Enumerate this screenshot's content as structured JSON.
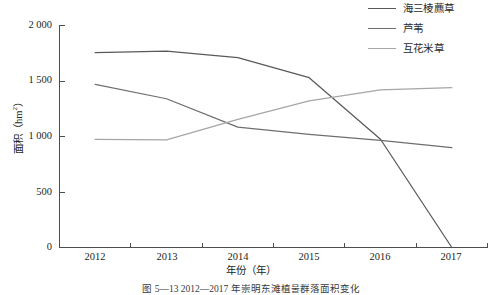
{
  "chart_data": {
    "type": "line",
    "title": "",
    "xlabel": "年份（年）",
    "ylabel": "面积（hm²）",
    "categories": [
      "2012",
      "2013",
      "2014",
      "2015",
      "2016",
      "2017"
    ],
    "x": [
      2012,
      2013,
      2014,
      2015,
      2016,
      2017
    ],
    "xlim": [
      2011.5,
      2017.5
    ],
    "ylim": [
      0,
      2000
    ],
    "yticks": [
      0,
      500,
      1000,
      1500,
      2000
    ],
    "ytick_labels": [
      "0",
      "500",
      "1 000",
      "1 500",
      "2 000"
    ],
    "xtick_labels": [
      "2012",
      "2013",
      "2014",
      "2015",
      "2016",
      "2017"
    ],
    "grid": false,
    "legend_position": "top-right",
    "series": [
      {
        "name": "海三棱藨草",
        "color": "#59595b",
        "values": [
          1755,
          1770,
          1710,
          1530,
          975,
          0
        ]
      },
      {
        "name": "芦苇",
        "color": "#6e6e70",
        "values": [
          1470,
          1340,
          1085,
          1020,
          965,
          900
        ]
      },
      {
        "name": "互花米草",
        "color": "#a6a6a8",
        "values": [
          975,
          970,
          1155,
          1320,
          1420,
          1440
        ]
      }
    ]
  },
  "legend": {
    "items": [
      {
        "label": "海三棱藨草",
        "color": "#59595b"
      },
      {
        "label": "芦苇",
        "color": "#6e6e70"
      },
      {
        "label": "互花米草",
        "color": "#a6a6a8"
      }
    ]
  },
  "axes": {
    "y_title_main": "面积（hm",
    "y_title_sup": "2",
    "y_title_end": "）",
    "x_title": "年份（年）",
    "yticks": [
      "2 000",
      "1 500",
      "1 000",
      "500",
      "0"
    ],
    "xticks": [
      "2012",
      "2013",
      "2014",
      "2015",
      "2016",
      "2017"
    ],
    "axis_color": "#4d4d4f"
  },
  "caption": {
    "text": "图 5—13  2012—2017 年崇明东滩植물群落面积变化"
  }
}
